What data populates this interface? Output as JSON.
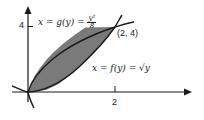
{
  "diagram": {
    "type": "region-between-curves",
    "curve_upper": {
      "label_lhs": "x = g(y) =",
      "frac_num": "y²",
      "frac_den": "8",
      "equation": "x = y^2/8"
    },
    "curve_lower": {
      "label": "x = f(y) = √y",
      "equation": "x = sqrt(y)"
    },
    "intersection_label": "(2, 4)",
    "y_tick_label": "4",
    "x_tick_label": "2",
    "colors": {
      "shade": "#7a7a7a",
      "stroke": "#1a1a1a",
      "background": "#ffffff"
    }
  }
}
